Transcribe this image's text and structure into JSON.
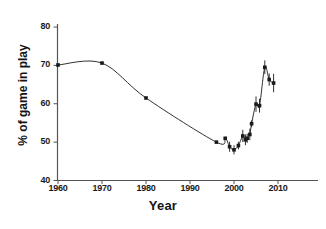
{
  "chart_data": {
    "type": "scatter",
    "title": "",
    "subtitle": "",
    "xlabel": "Year",
    "ylabel": "% of game in play",
    "xlim": [
      1957,
      2017
    ],
    "ylim": [
      40,
      80
    ],
    "xticks": [
      1960,
      1970,
      1980,
      1990,
      2000,
      2010
    ],
    "xtick_labels": [
      "1960",
      "1970",
      "1980",
      "1990",
      "2000",
      "2010"
    ],
    "yticks": [
      40,
      50,
      60,
      70,
      80
    ],
    "ytick_labels": [
      "40",
      "50",
      "60",
      "70",
      "80"
    ],
    "grid": false,
    "legend": null,
    "legend_position": "none",
    "marker": "filled-square",
    "line_style": "smooth-spline",
    "series": [
      {
        "name": "% of game in play",
        "color": "#1a1a1a",
        "points": [
          {
            "x": 1960,
            "y": 70.1,
            "yerr": 0.0
          },
          {
            "x": 1970,
            "y": 70.6,
            "yerr": 0.0
          },
          {
            "x": 1980,
            "y": 61.5,
            "yerr": 0.0
          },
          {
            "x": 1996,
            "y": 50.0,
            "yerr": 0.0
          },
          {
            "x": 1998,
            "y": 51.0,
            "yerr": 0.0
          },
          {
            "x": 1999,
            "y": 48.8,
            "yerr": 1.3
          },
          {
            "x": 2000,
            "y": 48.0,
            "yerr": 1.2
          },
          {
            "x": 2001,
            "y": 49.1,
            "yerr": 1.0
          },
          {
            "x": 2002,
            "y": 51.6,
            "yerr": 1.6
          },
          {
            "x": 2002.6,
            "y": 50.6,
            "yerr": 1.4
          },
          {
            "x": 2003,
            "y": 51.0,
            "yerr": 1.2
          },
          {
            "x": 2003.6,
            "y": 52.0,
            "yerr": 1.5
          },
          {
            "x": 2004,
            "y": 54.8,
            "yerr": 0.9
          },
          {
            "x": 2005,
            "y": 59.9,
            "yerr": 2.0
          },
          {
            "x": 2005.8,
            "y": 59.5,
            "yerr": 1.8
          },
          {
            "x": 2007,
            "y": 69.5,
            "yerr": 1.8
          },
          {
            "x": 2008,
            "y": 66.3,
            "yerr": 1.6
          },
          {
            "x": 2009,
            "y": 65.4,
            "yerr": 2.4
          }
        ]
      }
    ]
  },
  "axes": {
    "x_title": "Year",
    "y_title": "% of game in play"
  }
}
